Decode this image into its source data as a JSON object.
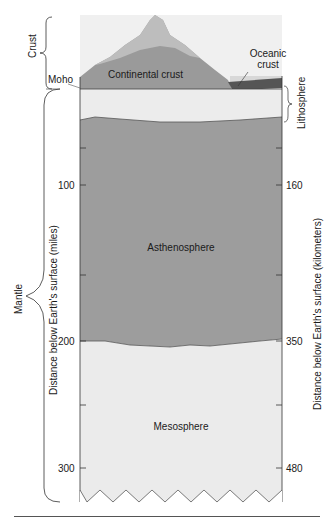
{
  "diagram": {
    "layers": {
      "continental_crust": "Continental crust",
      "oceanic_crust_line1": "Oceanic",
      "oceanic_crust_line2": "crust",
      "asthenosphere": "Asthenosphere",
      "mesosphere": "Mesosphere"
    },
    "left_labels": {
      "crust": "Crust",
      "moho": "Moho",
      "mantle": "Mantle"
    },
    "right_labels": {
      "lithosphere": "Lithosphere"
    },
    "axes": {
      "left_title": "Distance below Earth's surface (miles)",
      "right_title": "Distance below Earth's surface (kilometers)",
      "left_ticks": [
        "100",
        "200",
        "300"
      ],
      "right_ticks": [
        "160",
        "350",
        "480"
      ]
    },
    "colors": {
      "sky": "#eeeeee",
      "continental": "#9a9a9a",
      "mountain": "#b5b5b5",
      "oceanic": "#5a5a5a",
      "ocean_water": "#d9d9d9",
      "lithosphere_mantle": "#ececec",
      "asthenosphere": "#9c9c9c",
      "mesosphere": "#ebebeb"
    }
  }
}
